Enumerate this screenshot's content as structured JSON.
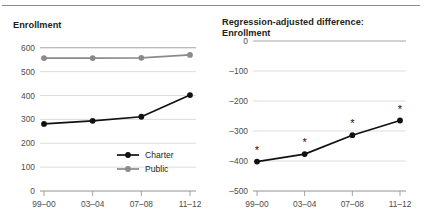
{
  "figure": {
    "rule_color": "#8c8c8c",
    "background": "#ffffff"
  },
  "chart_data": [
    {
      "id": "enrollment",
      "type": "line",
      "title": "Enrollment",
      "xlabel": "",
      "ylabel": "",
      "categories": [
        "99–00",
        "03–04",
        "07–08",
        "11–12"
      ],
      "yticks": [
        0,
        100,
        200,
        300,
        400,
        500,
        600
      ],
      "yticklabels": [
        "0",
        "100",
        "200",
        "300",
        "400",
        "500",
        "600"
      ],
      "ylim": [
        0,
        620
      ],
      "grid": true,
      "legend_position": "inside-lower-right",
      "series": [
        {
          "name": "Charter",
          "color": "#111111",
          "values": [
            281,
            294,
            311,
            402
          ]
        },
        {
          "name": "Public",
          "color": "#8a8a8a",
          "values": [
            557,
            557,
            558,
            570
          ]
        }
      ]
    },
    {
      "id": "regression-adjusted-difference",
      "type": "line",
      "title": "Regression-adjusted difference:\nEnrollment",
      "xlabel": "",
      "ylabel": "",
      "categories": [
        "99–00",
        "03–04",
        "07–08",
        "11–12"
      ],
      "yticks": [
        0,
        -100,
        -200,
        -300,
        -400,
        -500
      ],
      "yticklabels": [
        "0",
        "–100",
        "–200",
        "–300",
        "–400",
        "–500"
      ],
      "ylim": [
        -500,
        0
      ],
      "grid": true,
      "legend_position": "none",
      "significance_marker": "*",
      "series": [
        {
          "name": "Regression-adjusted difference",
          "color": "#111111",
          "values": [
            -402,
            -377,
            -314,
            -265
          ],
          "significant": [
            true,
            true,
            true,
            true
          ]
        }
      ]
    }
  ]
}
